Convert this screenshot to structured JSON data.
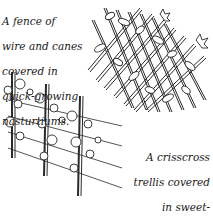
{
  "illustration": {
    "caption_fence": {
      "lines": [
        "A fence of",
        "wire and canes",
        "covered in",
        "quick-growing",
        "nasturtiums."
      ]
    },
    "caption_trellis": {
      "lines": [
        "A crisscross",
        "trellis covered",
        "in sweet-",
        "smelling",
        "honeysuckle."
      ]
    },
    "colors": {
      "ink": "#1a1a1a",
      "background": "#ffffff"
    }
  }
}
